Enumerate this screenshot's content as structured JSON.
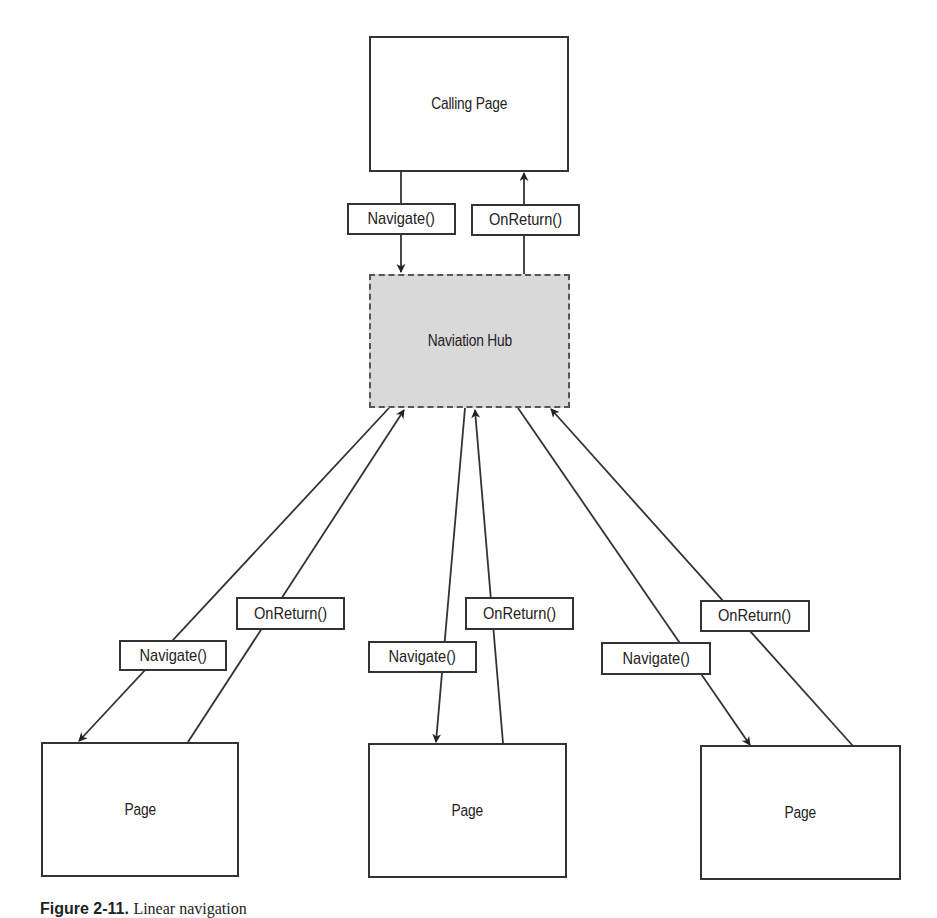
{
  "diagram": {
    "nodes": {
      "calling_page": {
        "label": "Calling Page"
      },
      "hub": {
        "label": "Naviation Hub"
      },
      "page_left": {
        "label": "Page"
      },
      "page_middle": {
        "label": "Page"
      },
      "page_right": {
        "label": "Page"
      }
    },
    "edge_labels": {
      "top_navigate": "Navigate()",
      "top_onreturn": "OnReturn()",
      "left_navigate": "Navigate()",
      "left_onreturn": "OnReturn()",
      "middle_navigate": "Navigate()",
      "middle_onreturn": "OnReturn()",
      "right_navigate": "Navigate()",
      "right_onreturn": "OnReturn()"
    },
    "edges": [
      {
        "from": "calling_page",
        "to": "hub",
        "label": "Navigate()"
      },
      {
        "from": "hub",
        "to": "calling_page",
        "label": "OnReturn()"
      },
      {
        "from": "hub",
        "to": "page_left",
        "label": "Navigate()"
      },
      {
        "from": "page_left",
        "to": "hub",
        "label": "OnReturn()"
      },
      {
        "from": "hub",
        "to": "page_middle",
        "label": "Navigate()"
      },
      {
        "from": "page_middle",
        "to": "hub",
        "label": "OnReturn()"
      },
      {
        "from": "hub",
        "to": "page_right",
        "label": "Navigate()"
      },
      {
        "from": "page_right",
        "to": "hub",
        "label": "OnReturn()"
      }
    ],
    "colors": {
      "line": "#333333",
      "hub_fill": "#d9d9d9",
      "box_fill": "#ffffff"
    }
  },
  "caption": {
    "figure": "Figure 2-11.",
    "text": "Linear navigation"
  }
}
